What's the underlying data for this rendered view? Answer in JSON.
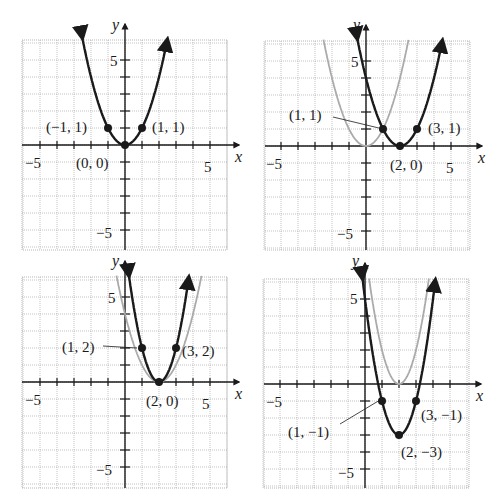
{
  "chart_data": [
    {
      "type": "line",
      "panel": "top-left",
      "title": "",
      "xlabel": "x",
      "ylabel": "y",
      "xlim": [
        -6,
        6
      ],
      "ylim": [
        -6,
        6
      ],
      "grid": true,
      "tick_labels": {
        "x": [
          "-5",
          "5"
        ],
        "y": [
          "5",
          "-5"
        ]
      },
      "series": [
        {
          "name": "f(x) = x^2",
          "style": "black",
          "equation": "y = x^2"
        }
      ],
      "points": [
        {
          "x": -1,
          "y": 1,
          "label": "(−1, 1)"
        },
        {
          "x": 0,
          "y": 0,
          "label": "(0, 0)"
        },
        {
          "x": 1,
          "y": 1,
          "label": "(1, 1)"
        }
      ]
    },
    {
      "type": "line",
      "panel": "top-right",
      "title": "",
      "xlabel": "x",
      "ylabel": "y",
      "xlim": [
        -6,
        6
      ],
      "ylim": [
        -6,
        6
      ],
      "grid": true,
      "tick_labels": {
        "x": [
          "-5",
          "5"
        ],
        "y": [
          "5",
          "-5"
        ]
      },
      "series": [
        {
          "name": "y = x^2",
          "style": "gray",
          "equation": "y = x^2"
        },
        {
          "name": "y = (x-2)^2",
          "style": "black",
          "equation": "y = (x-2)^2"
        }
      ],
      "points": [
        {
          "x": 1,
          "y": 1,
          "label": "(1, 1)"
        },
        {
          "x": 2,
          "y": 0,
          "label": "(2, 0)"
        },
        {
          "x": 3,
          "y": 1,
          "label": "(3, 1)"
        }
      ]
    },
    {
      "type": "line",
      "panel": "bottom-left",
      "title": "",
      "xlabel": "x",
      "ylabel": "y",
      "xlim": [
        -6,
        6
      ],
      "ylim": [
        -6,
        6
      ],
      "grid": true,
      "tick_labels": {
        "x": [
          "-5",
          "5"
        ],
        "y": [
          "5",
          "-5"
        ]
      },
      "series": [
        {
          "name": "y = (x-2)^2",
          "style": "gray",
          "equation": "y = (x-2)^2"
        },
        {
          "name": "y = 2(x-2)^2",
          "style": "black",
          "equation": "y = 2(x-2)^2"
        }
      ],
      "points": [
        {
          "x": 1,
          "y": 2,
          "label": "(1, 2)"
        },
        {
          "x": 2,
          "y": 0,
          "label": "(2, 0)"
        },
        {
          "x": 3,
          "y": 2,
          "label": "(3, 2)"
        }
      ]
    },
    {
      "type": "line",
      "panel": "bottom-right",
      "title": "",
      "xlabel": "x",
      "ylabel": "y",
      "xlim": [
        -6,
        6
      ],
      "ylim": [
        -6,
        6
      ],
      "grid": true,
      "tick_labels": {
        "x": [
          "-5",
          "5"
        ],
        "y": [
          "5",
          "-5"
        ]
      },
      "series": [
        {
          "name": "y = 2(x-2)^2",
          "style": "gray",
          "equation": "y = 2(x-2)^2"
        },
        {
          "name": "y = 2(x-2)^2 - 3",
          "style": "black",
          "equation": "y = 2(x-2)^2 - 3"
        }
      ],
      "points": [
        {
          "x": 1,
          "y": -1,
          "label": "(1, −1)"
        },
        {
          "x": 2,
          "y": -3,
          "label": "(2, −3)"
        },
        {
          "x": 3,
          "y": -1,
          "label": "(3, −1)"
        }
      ]
    }
  ],
  "panels": {
    "p1": {
      "xlabel": "x",
      "ylabel": "y",
      "xneg": "−5",
      "xpos": "5",
      "ypos": "5",
      "yneg": "−5",
      "pt_a": "(−1, 1)",
      "pt_b": "(0, 0)",
      "pt_c": "(1, 1)"
    },
    "p2": {
      "xlabel": "x",
      "ylabel": "y",
      "xneg": "−5",
      "xpos": "5",
      "ypos": "5",
      "yneg": "−5",
      "pt_a": "(1, 1)",
      "pt_b": "(2, 0)",
      "pt_c": "(3, 1)"
    },
    "p3": {
      "xlabel": "x",
      "ylabel": "y",
      "xneg": "−5",
      "xpos": "5",
      "ypos": "5",
      "yneg": "−5",
      "pt_a": "(1, 2)",
      "pt_b": "(2, 0)",
      "pt_c": "(3, 2)"
    },
    "p4": {
      "xlabel": "x",
      "ylabel": "y",
      "xneg": "−5",
      "xpos": "5",
      "ypos": "5",
      "yneg": "−5",
      "pt_a": "(1, −1)",
      "pt_b": "(2, −3)",
      "pt_c": "(3, −1)"
    }
  },
  "colors": {
    "main_curve": "#1a1a1a",
    "reference_curve": "#aaaaaa",
    "grid": "#9a9a9a"
  }
}
